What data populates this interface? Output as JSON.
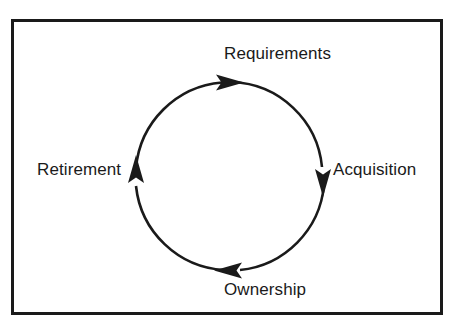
{
  "diagram": {
    "type": "cycle",
    "title": "",
    "direction": "clockwise",
    "border_color": "#1a1a1a",
    "stroke_color": "#1a1a1a",
    "background_color": "#ffffff",
    "nodes": [
      {
        "id": "requirements",
        "label": "Requirements",
        "position": "top",
        "arrow": "clockwise-right",
        "angle_deg": 270
      },
      {
        "id": "acquisition",
        "label": "Acquisition",
        "position": "right",
        "arrow": "clockwise-down",
        "angle_deg": 0
      },
      {
        "id": "ownership",
        "label": "Ownership",
        "position": "bottom",
        "arrow": "clockwise-left",
        "angle_deg": 90
      },
      {
        "id": "retirement",
        "label": "Retirement",
        "position": "left",
        "arrow": "clockwise-up",
        "angle_deg": 180
      }
    ]
  }
}
